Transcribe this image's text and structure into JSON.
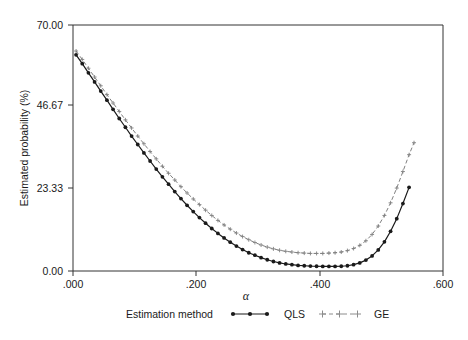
{
  "chart_data": {
    "type": "line",
    "title": "",
    "subtitle": "",
    "xlabel": "α",
    "ylabel": "Estimated probability (%)",
    "xlim": [
      0.0,
      0.6
    ],
    "ylim": [
      0.0,
      70.0
    ],
    "grid": false,
    "legend_position": "bottom",
    "legend_title": "Estimation method",
    "xticks": [
      0.0,
      0.2,
      0.4,
      0.6
    ],
    "xticklabels": [
      ".000",
      ".200",
      ".400",
      ".600"
    ],
    "yticks": [
      0.0,
      23.33,
      46.67,
      70.0
    ],
    "yticklabels": [
      "0.00",
      "23.33",
      "46.67",
      "70.00"
    ],
    "series": [
      {
        "name": "QLS",
        "color": "#1a1a1a",
        "linestyle": "solid",
        "marker": "circle",
        "x": [
          0.005,
          0.015,
          0.025,
          0.035,
          0.045,
          0.055,
          0.065,
          0.075,
          0.085,
          0.095,
          0.105,
          0.115,
          0.125,
          0.135,
          0.145,
          0.155,
          0.165,
          0.175,
          0.185,
          0.195,
          0.205,
          0.215,
          0.225,
          0.235,
          0.245,
          0.255,
          0.265,
          0.275,
          0.285,
          0.295,
          0.305,
          0.315,
          0.325,
          0.335,
          0.345,
          0.355,
          0.365,
          0.375,
          0.385,
          0.395,
          0.405,
          0.415,
          0.425,
          0.435,
          0.445,
          0.455,
          0.465,
          0.475,
          0.485,
          0.495,
          0.505,
          0.515,
          0.525,
          0.535,
          0.545
        ],
        "y": [
          61.5,
          59.0,
          56.4,
          53.8,
          51.2,
          48.6,
          46.0,
          43.4,
          40.9,
          38.4,
          36.0,
          33.6,
          31.3,
          29.0,
          26.8,
          24.7,
          22.6,
          20.6,
          18.7,
          16.9,
          15.2,
          13.6,
          12.1,
          10.7,
          9.4,
          8.2,
          7.1,
          6.1,
          5.2,
          4.5,
          3.8,
          3.2,
          2.7,
          2.3,
          2.0,
          1.8,
          1.6,
          1.5,
          1.4,
          1.35,
          1.3,
          1.3,
          1.3,
          1.35,
          1.5,
          1.8,
          2.3,
          3.1,
          4.3,
          6.0,
          8.3,
          11.3,
          14.9,
          19.2,
          23.8
        ]
      },
      {
        "name": "GE",
        "color": "#808080",
        "linestyle": "dashed",
        "marker": "plus",
        "x": [
          0.005,
          0.015,
          0.025,
          0.035,
          0.045,
          0.055,
          0.065,
          0.075,
          0.085,
          0.095,
          0.105,
          0.115,
          0.125,
          0.135,
          0.145,
          0.155,
          0.165,
          0.175,
          0.185,
          0.195,
          0.205,
          0.215,
          0.225,
          0.235,
          0.245,
          0.255,
          0.265,
          0.275,
          0.285,
          0.295,
          0.305,
          0.315,
          0.325,
          0.335,
          0.345,
          0.355,
          0.365,
          0.375,
          0.385,
          0.395,
          0.405,
          0.415,
          0.425,
          0.435,
          0.445,
          0.455,
          0.465,
          0.475,
          0.485,
          0.495,
          0.505,
          0.515,
          0.525,
          0.535,
          0.545,
          0.553
        ],
        "y": [
          62.6,
          60.2,
          57.7,
          55.2,
          52.7,
          50.2,
          47.8,
          45.4,
          43.0,
          40.7,
          38.4,
          36.2,
          34.0,
          31.9,
          29.8,
          27.8,
          25.9,
          24.0,
          22.2,
          20.5,
          18.9,
          17.3,
          15.8,
          14.4,
          13.1,
          11.9,
          10.8,
          9.8,
          8.9,
          8.1,
          7.4,
          6.8,
          6.3,
          5.9,
          5.6,
          5.4,
          5.2,
          5.1,
          5.0,
          5.0,
          5.0,
          5.1,
          5.2,
          5.4,
          5.8,
          6.4,
          7.3,
          8.6,
          10.4,
          12.8,
          15.8,
          19.4,
          23.6,
          28.3,
          33.1,
          36.5
        ]
      }
    ]
  },
  "axis": {
    "y_title": "Estimated probability (%)",
    "x_title": "α",
    "x_tick_labels": [
      ".000",
      ".200",
      ".400",
      ".600"
    ],
    "y_tick_labels": [
      "70.00",
      "46.67",
      "23.33",
      "0.00"
    ]
  },
  "legend": {
    "title": "Estimation method",
    "entries": [
      {
        "label": "QLS",
        "marker": "filled-circle",
        "line": "solid",
        "color": "#1a1a1a"
      },
      {
        "label": "GE",
        "marker": "plus",
        "line": "dashed",
        "color": "#8c8c8c"
      }
    ]
  }
}
